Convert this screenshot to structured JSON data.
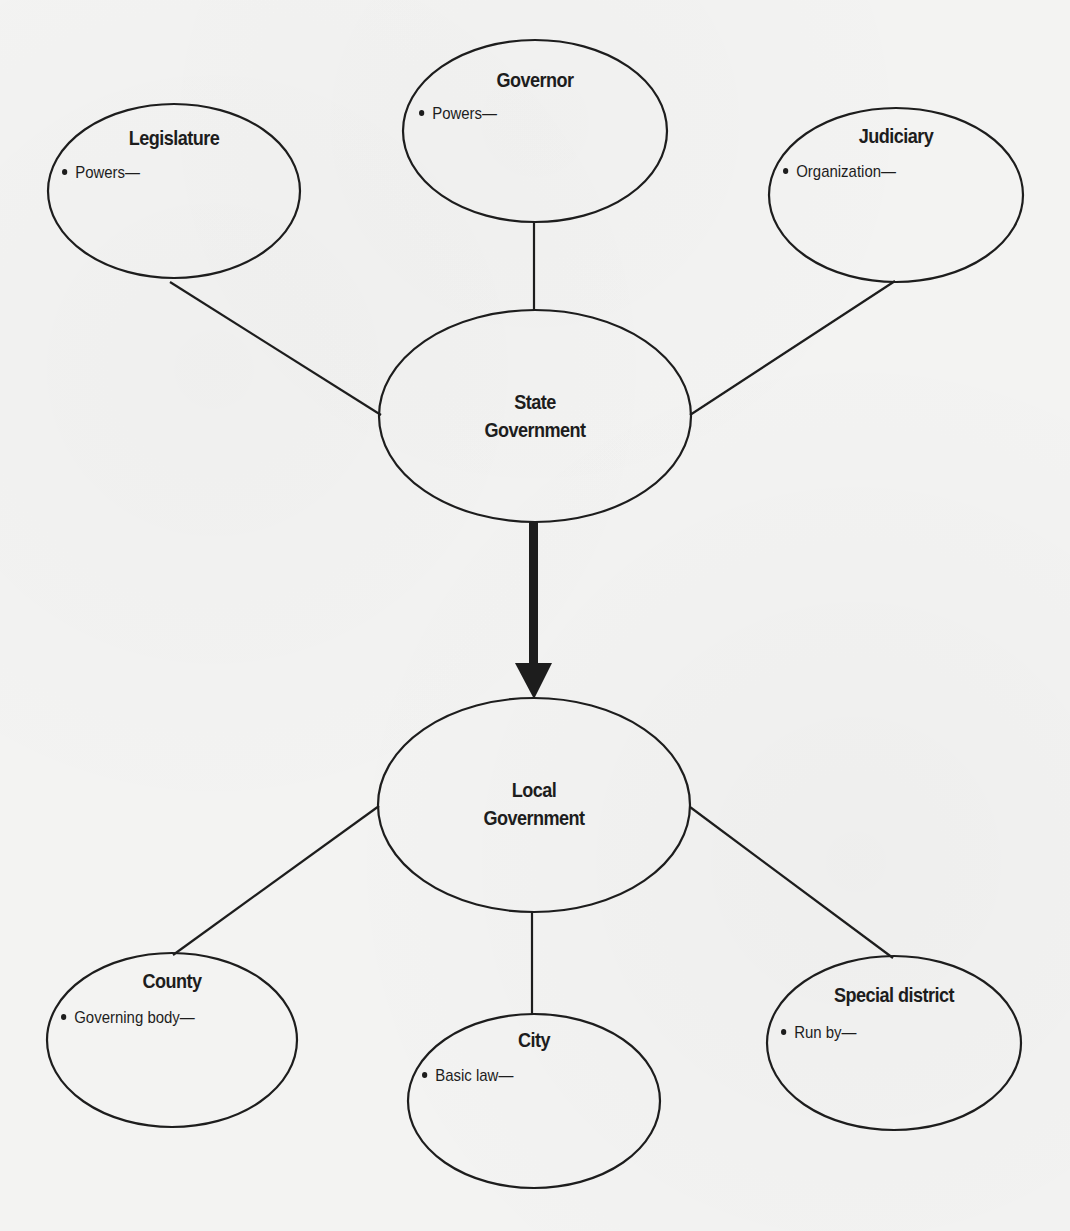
{
  "diagram": {
    "title": "",
    "colors": {
      "background": "#f3f3f2",
      "stroke": "#1d1d1d",
      "text": "#1d1d1d"
    },
    "center_nodes": {
      "state": {
        "line1": "State",
        "line2": "Government"
      },
      "local": {
        "line1": "Local",
        "line2": "Government"
      }
    },
    "state_branches": [
      {
        "id": "legislature",
        "title": "Legislature",
        "bullet": "Powers—"
      },
      {
        "id": "governor",
        "title": "Governor",
        "bullet": "Powers—"
      },
      {
        "id": "judiciary",
        "title": "Judiciary",
        "bullet": "Organization—"
      }
    ],
    "local_branches": [
      {
        "id": "county",
        "title": "County",
        "bullet": "Governing body—"
      },
      {
        "id": "city",
        "title": "City",
        "bullet": "Basic law—"
      },
      {
        "id": "special-district",
        "title": "Special district",
        "bullet": "Run by—"
      }
    ],
    "arrow": {
      "from": "State Government",
      "to": "Local Government",
      "direction": "down"
    }
  }
}
